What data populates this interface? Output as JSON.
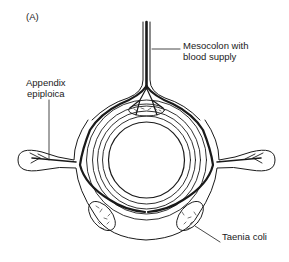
{
  "figure": {
    "panel_label": "(A)",
    "labels": {
      "mesocolon": "Mesocolon with\nblood supply",
      "appendix": "Appendix\nepiploica",
      "taenia": "Taenia coli"
    }
  },
  "colors": {
    "line": "#1a1a1a",
    "background": "#ffffff"
  }
}
